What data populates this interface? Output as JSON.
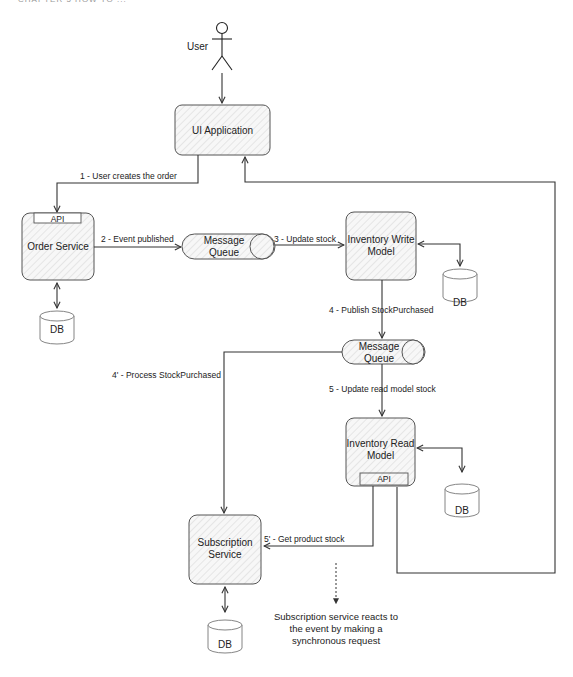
{
  "header": {
    "cut_off_text": "CHAPTER 5    HOW TO ..."
  },
  "actors": {
    "user": {
      "label": "User",
      "icon": "stick-figure-icon"
    }
  },
  "nodes": {
    "ui_app": {
      "label": "UI Application"
    },
    "order_service": {
      "label": "Order Service",
      "api_tab": "API"
    },
    "message_queue_1": {
      "line1": "Message",
      "line2": "Queue"
    },
    "inventory_write": {
      "line1": "Inventory Write",
      "line2": "Model"
    },
    "message_queue_2": {
      "line1": "Message",
      "line2": "Queue"
    },
    "inventory_read": {
      "line1": "Inventory Read",
      "line2": "Model",
      "api_tab": "API"
    },
    "subscription_service": {
      "line1": "Subscription",
      "line2": "Service"
    },
    "db_order": {
      "label": "DB"
    },
    "db_write": {
      "label": "DB"
    },
    "db_read": {
      "label": "DB"
    },
    "db_subscription": {
      "label": "DB"
    }
  },
  "edges": {
    "e1": "1 - User creates the order",
    "e2": "2 - Event published",
    "e3": "3 - Update stock",
    "e4": "4 - Publish StockPurchased",
    "e4p": "4' - Process StockPurchased",
    "e5": "5 - Update read model stock",
    "e5p": "5' - Get product stock"
  },
  "annotation": {
    "line1": "Subscription service reacts to",
    "line2": "the event by making a",
    "line3": "synchronous request"
  },
  "colors": {
    "stroke": "#333333",
    "hatch": "#cfcfcf",
    "fill": "#f6f6f6"
  }
}
